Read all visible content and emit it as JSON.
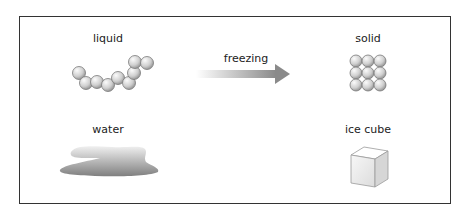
{
  "diagram": {
    "title_process": "freezing",
    "states": [
      {
        "name": "liquid",
        "example": "water"
      },
      {
        "name": "solid",
        "example": "ice cube"
      }
    ],
    "arrow_label": "freezing",
    "colors": {
      "frame": "#333333",
      "sphere_light": "#f4f4f4",
      "sphere_dark": "#9a9a9a",
      "arrow_start": "#e8e8e8",
      "arrow_end": "#8c8c8c",
      "water_light": "#e6e6e6",
      "water_dark": "#8a8a8a"
    }
  }
}
